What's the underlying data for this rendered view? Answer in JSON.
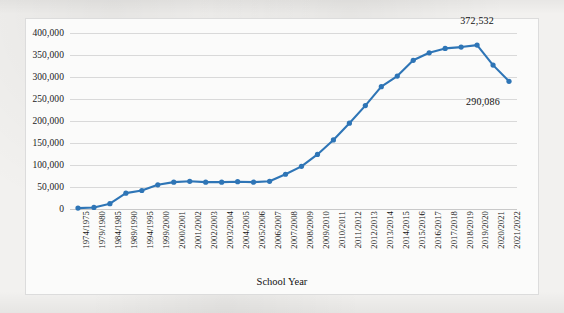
{
  "chart_data": {
    "type": "line",
    "title": "",
    "xlabel": "School Year",
    "ylabel": "",
    "ylim": [
      0,
      400000
    ],
    "ytick_step": 50000,
    "grid": true,
    "legend": "none",
    "series_color": "#2E75B6",
    "yticks": [
      "0",
      "50,000",
      "100,000",
      "150,000",
      "200,000",
      "250,000",
      "300,000",
      "350,000",
      "400,000"
    ],
    "ytick_values": [
      0,
      50000,
      100000,
      150000,
      200000,
      250000,
      300000,
      350000,
      400000
    ],
    "categories": [
      "1974/1975",
      "1979/1980",
      "1984/1985",
      "1989/1990",
      "1994/1995",
      "1999/2000",
      "2000/2001",
      "2001/2002",
      "2002/2003",
      "2003/2004",
      "2004/2005",
      "2005/2006",
      "2006/2007",
      "2007/2008",
      "2008/2009",
      "2009/2010",
      "2010/2011",
      "2011/2012",
      "2012/2013",
      "2013/2014",
      "2014/2015",
      "2015/2016",
      "2016/2017",
      "2017/2018",
      "2018/2019",
      "2019/2020",
      "2020/2021",
      "2021/2022"
    ],
    "values": [
      2000,
      3500,
      12000,
      36000,
      42000,
      55000,
      61000,
      63000,
      61000,
      61000,
      62000,
      61000,
      63000,
      79000,
      97000,
      124000,
      157000,
      195000,
      235000,
      278000,
      302000,
      338000,
      355000,
      365000,
      368000,
      372532,
      327000,
      290086
    ],
    "annotations": [
      {
        "index": 25,
        "text": "372,532",
        "value": 372532
      },
      {
        "index": 27,
        "text": "290,086",
        "value": 290086
      }
    ]
  }
}
